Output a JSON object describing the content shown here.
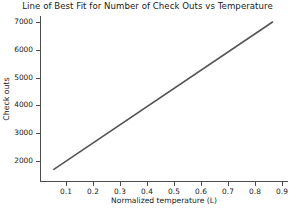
{
  "chart_data": {
    "type": "line",
    "title": "Line of Best Fit for Number of Check Outs vs Temperature",
    "xlabel": "Normalized temperature (L)",
    "ylabel": "Check outs",
    "grid": false,
    "legend": null,
    "xlim": [
      0.02,
      0.93
    ],
    "ylim": [
      1500,
      7250
    ],
    "xticks": [
      0.1,
      0.2,
      0.3,
      0.4,
      0.5,
      0.6,
      0.7,
      0.8,
      0.9
    ],
    "xtick_labels": [
      "0.1",
      "0.2",
      "0.3",
      "0.4",
      "0.5",
      "0.6",
      "0.7",
      "0.8",
      "0.9"
    ],
    "yticks": [
      2000,
      3000,
      4000,
      5000,
      6000,
      7000
    ],
    "ytick_labels": [
      "2000",
      "3000",
      "4000",
      "5000",
      "6000",
      "7000"
    ],
    "series": [
      {
        "name": "Line of best fit",
        "color": "#555555",
        "linewidth": 1.6,
        "x": [
          0.055,
          0.865
        ],
        "values": [
          1700,
          7000
        ]
      }
    ],
    "fit": {
      "slope": 6543,
      "intercept": 1340
    }
  },
  "axes": {
    "title": "Line of Best Fit for Number of Check Outs vs Temperature",
    "xlabel": "Normalized temperature (L)",
    "ylabel": "Check outs"
  }
}
